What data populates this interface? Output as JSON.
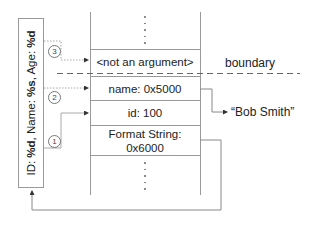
{
  "format_string_box": {
    "prefix_1": "ID: ",
    "spec_1": "%d",
    "prefix_2": ", Name: ",
    "spec_2": "%s",
    "prefix_3": ", Age: ",
    "spec_3": "%d"
  },
  "stack": {
    "rows": [
      {
        "label": "<not an argument>"
      },
      {
        "label": "name: 0x5000"
      },
      {
        "label": "id: 100"
      },
      {
        "label": "Format String:",
        "label2": "0x6000"
      }
    ]
  },
  "pointers": [
    {
      "number": "3",
      "target": "<not an argument>"
    },
    {
      "number": "2",
      "target": "name: 0x5000"
    },
    {
      "number": "1",
      "target": "id: 100"
    }
  ],
  "boundary_label": "boundary",
  "name_target": "“Bob Smith”",
  "colors": {
    "line": "#999999",
    "text": "#222222",
    "arrow": "#333333"
  }
}
